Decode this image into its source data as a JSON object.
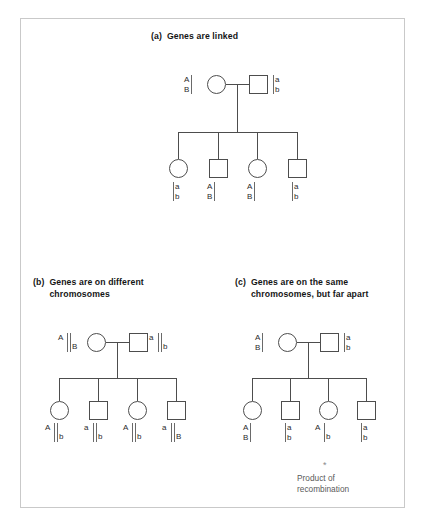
{
  "figure": {
    "background": "#ffffff",
    "border_color": "#c9c9c9",
    "line_color": "#4d4d4d"
  },
  "panels": {
    "a": {
      "tag": "(a)",
      "heading": "Genes are linked",
      "parents": {
        "mother": {
          "symbol": "circle",
          "top": "A",
          "bottom": "B",
          "bar_side": "right",
          "bars": 1,
          "layout": "stacked"
        },
        "father": {
          "symbol": "square",
          "top": "a",
          "bottom": "b",
          "bar_side": "left",
          "bars": 1,
          "layout": "stacked"
        }
      },
      "children": [
        {
          "symbol": "circle",
          "top": "a",
          "bottom": "b",
          "bar_side": "left",
          "bars": 1,
          "layout": "stacked"
        },
        {
          "symbol": "square",
          "top": "A",
          "bottom": "B",
          "bar_side": "right",
          "bars": 1,
          "layout": "stacked"
        },
        {
          "symbol": "circle",
          "top": "A",
          "bottom": "B",
          "bar_side": "right",
          "bars": 1,
          "layout": "stacked"
        },
        {
          "symbol": "square",
          "top": "a",
          "bottom": "b",
          "bar_side": "left",
          "bars": 1,
          "layout": "stacked"
        }
      ]
    },
    "b": {
      "tag": "(b)",
      "heading": "Genes are on different\nchromosomes",
      "parents": {
        "mother": {
          "symbol": "circle",
          "top": "A",
          "bottom": "B",
          "bars": 2,
          "layout": "diagonal"
        },
        "father": {
          "symbol": "square",
          "top": "a",
          "bottom": "b",
          "bars": 2,
          "layout": "diagonal"
        }
      },
      "children": [
        {
          "symbol": "circle",
          "top": "A",
          "bottom": "b",
          "bars": 2,
          "layout": "diagonal"
        },
        {
          "symbol": "square",
          "top": "a",
          "bottom": "b",
          "bars": 2,
          "layout": "diagonal"
        },
        {
          "symbol": "circle",
          "top": "A",
          "bottom": "b",
          "bars": 2,
          "layout": "diagonal"
        },
        {
          "symbol": "square",
          "top": "a",
          "bottom": "B",
          "bars": 2,
          "layout": "diagonal"
        }
      ]
    },
    "c": {
      "tag": "(c)",
      "heading": "Genes are on the same\nchromosomes, but far apart",
      "parents": {
        "mother": {
          "symbol": "circle",
          "top": "A",
          "bottom": "B",
          "bar_side": "right",
          "bars": 1,
          "layout": "stacked"
        },
        "father": {
          "symbol": "square",
          "top": "a",
          "bottom": "b",
          "bar_side": "left",
          "bars": 1,
          "layout": "stacked"
        }
      },
      "children": [
        {
          "symbol": "circle",
          "top": "A",
          "bottom": "B",
          "bar_side": "right",
          "bars": 1,
          "layout": "stacked"
        },
        {
          "symbol": "square",
          "top": "a",
          "bottom": "b",
          "bar_side": "left",
          "bars": 1,
          "layout": "stacked"
        },
        {
          "symbol": "circle",
          "top": "A",
          "bottom": "b",
          "bars": 1,
          "layout": "diagonal"
        },
        {
          "symbol": "square",
          "top": "a",
          "bottom": "b",
          "bar_side": "left",
          "bars": 1,
          "layout": "stacked"
        }
      ],
      "annotation": {
        "mark": "*",
        "text": "Product of\nrecombination"
      }
    }
  }
}
